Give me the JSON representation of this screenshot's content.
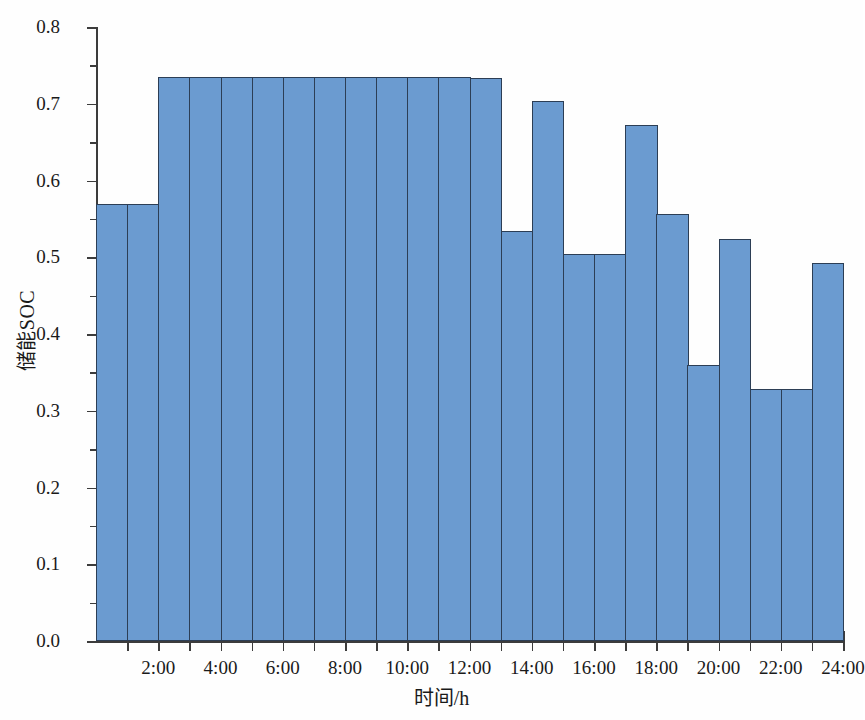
{
  "chart_data": {
    "type": "bar",
    "title": "",
    "xlabel": "时间/h",
    "ylabel": "储能SOC",
    "xlim": [
      0,
      24
    ],
    "ylim": [
      0.0,
      0.8
    ],
    "grid": false,
    "legend": null,
    "bar_color": "#6b9bd0",
    "bar_edge_color": "#2c3e55",
    "background_color": "#fefefe",
    "axis_color": "#3c3c3c",
    "x": [
      1,
      2,
      3,
      4,
      5,
      6,
      7,
      8,
      9,
      10,
      11,
      12,
      13,
      14,
      15,
      16,
      17,
      18,
      19,
      20,
      21,
      22,
      23,
      24
    ],
    "categories": [
      "1:00",
      "2:00",
      "3:00",
      "4:00",
      "5:00",
      "6:00",
      "7:00",
      "8:00",
      "9:00",
      "10:00",
      "11:00",
      "12:00",
      "13:00",
      "14:00",
      "15:00",
      "16:00",
      "17:00",
      "18:00",
      "19:00",
      "20:00",
      "21:00",
      "22:00",
      "23:00",
      "24:00"
    ],
    "values": [
      0.57,
      0.57,
      0.735,
      0.735,
      0.735,
      0.735,
      0.735,
      0.735,
      0.735,
      0.735,
      0.735,
      0.735,
      0.734,
      0.534,
      0.703,
      0.504,
      0.504,
      0.672,
      0.557,
      0.359,
      0.524,
      0.328,
      0.328,
      0.493
    ],
    "ytick_labels": [
      "0.0",
      "0.1",
      "0.2",
      "0.3",
      "0.4",
      "0.5",
      "0.6",
      "0.7",
      "0.8"
    ],
    "ytick_values": [
      0.0,
      0.1,
      0.2,
      0.3,
      0.4,
      0.5,
      0.6,
      0.7,
      0.8
    ],
    "yminor_tick_values": [
      0.05,
      0.15,
      0.25,
      0.35,
      0.45,
      0.55,
      0.65,
      0.75
    ],
    "xtick_labels": [
      "2:00",
      "4:00",
      "6:00",
      "8:00",
      "10:00",
      "12:00",
      "14:00",
      "16:00",
      "18:00",
      "20:00",
      "22:00",
      "24:00"
    ],
    "xtick_values": [
      2,
      4,
      6,
      8,
      10,
      12,
      14,
      16,
      18,
      20,
      22,
      24
    ]
  }
}
